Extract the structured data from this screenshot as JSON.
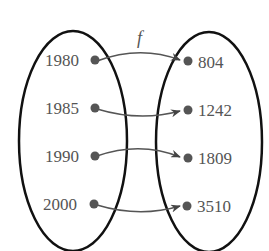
{
  "diagram": {
    "function_label": "f",
    "domain": [
      "1980",
      "1985",
      "1990",
      "2000"
    ],
    "range": [
      "804",
      "1242",
      "1809",
      "3510"
    ],
    "mapping": [
      {
        "from": "1980",
        "to": "804"
      },
      {
        "from": "1985",
        "to": "1242"
      },
      {
        "from": "1990",
        "to": "1809"
      },
      {
        "from": "2000",
        "to": "3510"
      }
    ],
    "colors": {
      "ellipse": "#111111",
      "dot": "#555555",
      "arrow": "#555555",
      "text": "#555555"
    }
  }
}
